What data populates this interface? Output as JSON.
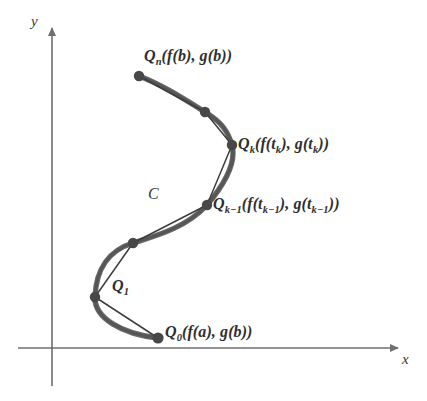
{
  "figure": {
    "background_color": "#ffffff",
    "curve_color": "#5a5a5a",
    "chord_color": "#3a3a3a",
    "axis_color": "#6f6f6f",
    "node_color": "#4a4a4a",
    "text_color": "#2f2f2f"
  },
  "axes": {
    "x_label": "x",
    "y_label": "y",
    "origin": {
      "x": 52,
      "y": 348
    },
    "x_axis_end": {
      "x": 404,
      "y": 348
    },
    "y_axis_end": {
      "x": 52,
      "y": 22
    }
  },
  "curve": {
    "name": "C",
    "label": "C",
    "label_position": {
      "x": 148,
      "y": 186
    }
  },
  "points": [
    {
      "id": "Q0",
      "name": "Q-zero",
      "label_parts": {
        "base": "Q",
        "sub": "0",
        "rest": "(f(a),  g(b))"
      },
      "label": "Q0(f(a), g(b))",
      "position": {
        "x": 158,
        "y": 338
      },
      "label_position": {
        "x": 165,
        "y": 324
      }
    },
    {
      "id": "Q1",
      "name": "Q-one",
      "label_parts": {
        "base": "Q",
        "sub": "1",
        "rest": ""
      },
      "label": "Q1",
      "position": {
        "x": 95,
        "y": 297
      },
      "label_position": {
        "x": 112,
        "y": 278
      }
    },
    {
      "id": "Q2",
      "name": "Q-unlabeled-lower",
      "label_parts": {
        "base": "",
        "sub": "",
        "rest": ""
      },
      "label": "",
      "position": {
        "x": 133,
        "y": 243
      },
      "label_position": null
    },
    {
      "id": "Qk-1",
      "name": "Q-k-minus-one",
      "label_parts": {
        "base": "Q",
        "sub": "k−1",
        "rest": "(f(t",
        "sub2": "k−1",
        "rest2": "),  g(t",
        "sub3": "k−1",
        "rest3": "))"
      },
      "label": "Qk−1(f(tk−1), g(tk−1))",
      "position": {
        "x": 207,
        "y": 205
      },
      "label_position": {
        "x": 213,
        "y": 196
      }
    },
    {
      "id": "Qk",
      "name": "Q-k",
      "label_parts": {
        "base": "Q",
        "sub": "k",
        "rest": "(f(t",
        "sub2": "k",
        "rest2": "),  g(t",
        "sub3": "k",
        "rest3": "))"
      },
      "label": "Qk(f(tk), g(tk))",
      "position": {
        "x": 232,
        "y": 145
      },
      "label_position": {
        "x": 238,
        "y": 136
      }
    },
    {
      "id": "Qn-1",
      "name": "Q-unlabeled-upper",
      "label_parts": {
        "base": "",
        "sub": "",
        "rest": ""
      },
      "label": "",
      "position": {
        "x": 205,
        "y": 112
      },
      "label_position": null
    },
    {
      "id": "Qn",
      "name": "Q-n",
      "label_parts": {
        "base": "Q",
        "sub": "n",
        "rest": "(f(b),  g(b))"
      },
      "label": "Qn(f(b), g(b))",
      "position": {
        "x": 139,
        "y": 76
      },
      "label_position": {
        "x": 144,
        "y": 48
      }
    }
  ],
  "geometry": {
    "curve_path": "M 139 76 C 160 84, 178 95, 205 112 C 222 122, 228 132, 232 145 C 236 160, 228 180, 207 205 C 186 228, 155 236, 133 243 C 110 250, 96 268, 95 297 C 94 318, 122 334, 158 338",
    "chords": [
      {
        "from": "Qn",
        "to": "Qn-1"
      },
      {
        "from": "Qn-1",
        "to": "Qk"
      },
      {
        "from": "Qk",
        "to": "Qk-1"
      },
      {
        "from": "Qk-1",
        "to": "Q2"
      },
      {
        "from": "Q2",
        "to": "Q1"
      },
      {
        "from": "Q1",
        "to": "Q0"
      }
    ],
    "node_radius": 5
  }
}
